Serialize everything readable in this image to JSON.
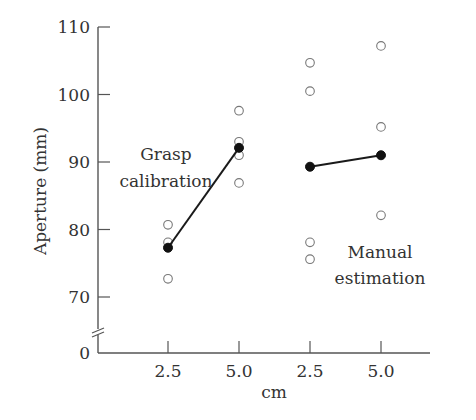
{
  "chart_data": {
    "type": "scatter",
    "title": "",
    "xlabel": "cm",
    "ylabel": "Aperture (mm)",
    "ylim": [
      65,
      110
    ],
    "y_axis_break": true,
    "y_ticks": [
      0,
      70,
      80,
      90,
      100,
      110
    ],
    "y_tick_labels": [
      "0",
      "70",
      "80",
      "90",
      "100",
      "110"
    ],
    "categories": [
      "2.5",
      "5.0",
      "2.5",
      "5.0"
    ],
    "groups": [
      {
        "name": "Grasp calibration",
        "label_lines": [
          "Grasp",
          "calibration"
        ],
        "category_indices": [
          0,
          1
        ],
        "individual_values": [
          [
            80.7,
            78.1,
            72.7
          ],
          [
            97.6,
            93.0,
            91.0,
            86.9
          ]
        ],
        "means": [
          77.3,
          92.1
        ]
      },
      {
        "name": "Manual estimation",
        "label_lines": [
          "Manual",
          "estimation"
        ],
        "category_indices": [
          2,
          3
        ],
        "individual_values": [
          [
            104.7,
            100.5,
            78.1,
            75.6
          ],
          [
            107.2,
            95.2,
            82.1
          ]
        ],
        "means": [
          89.3,
          91.0
        ]
      }
    ],
    "grid": false,
    "legend": "none"
  }
}
